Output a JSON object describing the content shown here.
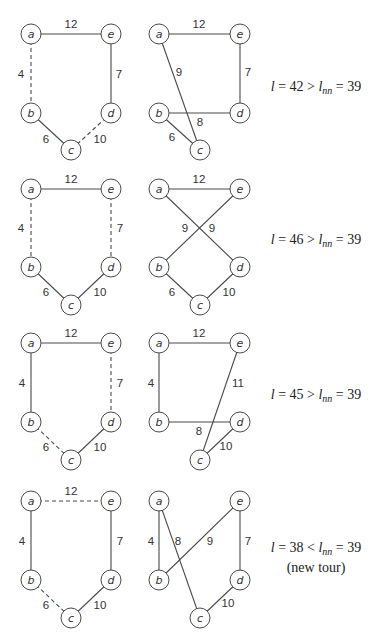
{
  "node_radius": 10,
  "rows": [
    {
      "y_offset": 0,
      "formula": {
        "l_symbol": "l",
        "value": "42",
        "op": ">",
        "nn_symbol": "l",
        "nn_sub": "nn",
        "nn_value": "39",
        "note": ""
      },
      "panels": [
        {
          "name": "original-tour",
          "nodes": {
            "a": [
              31,
              34
            ],
            "e": [
              111,
              34
            ],
            "b": [
              31,
              113
            ],
            "d": [
              111,
              113
            ],
            "c": [
              71,
              150
            ]
          },
          "edges": [
            {
              "from": "a",
              "to": "e",
              "weight": "12",
              "dashed": false,
              "label_pos": [
                71,
                24
              ]
            },
            {
              "from": "a",
              "to": "b",
              "weight": "4",
              "dashed": true,
              "label_pos": [
                21,
                74
              ]
            },
            {
              "from": "e",
              "to": "d",
              "weight": "7",
              "dashed": false,
              "label_pos": [
                119,
                74
              ]
            },
            {
              "from": "b",
              "to": "c",
              "weight": "6",
              "dashed": false,
              "label_pos": [
                46,
                139
              ]
            },
            {
              "from": "d",
              "to": "c",
              "weight": "10",
              "dashed": true,
              "label_pos": [
                100,
                139
              ]
            }
          ]
        },
        {
          "name": "modified-tour",
          "nodes": {
            "a": [
              159,
              34
            ],
            "e": [
              240,
              34
            ],
            "b": [
              159,
              113
            ],
            "d": [
              240,
              113
            ],
            "c": [
              200,
              150
            ]
          },
          "edges": [
            {
              "from": "a",
              "to": "e",
              "weight": "12",
              "dashed": false,
              "label_pos": [
                199,
                24
              ]
            },
            {
              "from": "a",
              "to": "c",
              "weight": "9",
              "dashed": false,
              "label_pos": [
                179,
                72
              ]
            },
            {
              "from": "e",
              "to": "d",
              "weight": "7",
              "dashed": false,
              "label_pos": [
                248,
                72
              ]
            },
            {
              "from": "b",
              "to": "d",
              "weight": "8",
              "dashed": false,
              "label_pos": [
                200,
                122
              ]
            },
            {
              "from": "b",
              "to": "c",
              "weight": "6",
              "dashed": false,
              "label_pos": [
                172,
                137
              ]
            }
          ]
        }
      ]
    },
    {
      "y_offset": 0,
      "formula": {
        "l_symbol": "l",
        "value": "46",
        "op": ">",
        "nn_symbol": "l",
        "nn_sub": "nn",
        "nn_value": "39",
        "note": ""
      },
      "panels": [
        {
          "name": "original-tour",
          "nodes": {
            "a": [
              31,
              189
            ],
            "e": [
              111,
              189
            ],
            "b": [
              31,
              267
            ],
            "d": [
              111,
              267
            ],
            "c": [
              71,
              305
            ]
          },
          "edges": [
            {
              "from": "a",
              "to": "e",
              "weight": "12",
              "dashed": false,
              "label_pos": [
                71,
                179
              ]
            },
            {
              "from": "a",
              "to": "b",
              "weight": "4",
              "dashed": true,
              "label_pos": [
                21,
                228
              ]
            },
            {
              "from": "e",
              "to": "d",
              "weight": "7",
              "dashed": true,
              "label_pos": [
                120,
                228
              ]
            },
            {
              "from": "b",
              "to": "c",
              "weight": "6",
              "dashed": false,
              "label_pos": [
                46,
                292
              ]
            },
            {
              "from": "d",
              "to": "c",
              "weight": "10",
              "dashed": false,
              "label_pos": [
                100,
                292
              ]
            }
          ]
        },
        {
          "name": "modified-tour",
          "nodes": {
            "a": [
              159,
              189
            ],
            "e": [
              240,
              189
            ],
            "b": [
              159,
              267
            ],
            "d": [
              240,
              267
            ],
            "c": [
              200,
              305
            ]
          },
          "edges": [
            {
              "from": "a",
              "to": "e",
              "weight": "12",
              "dashed": false,
              "label_pos": [
                199,
                179
              ]
            },
            {
              "from": "a",
              "to": "d",
              "weight": "9",
              "dashed": false,
              "label_pos": [
                212,
                228
              ]
            },
            {
              "from": "e",
              "to": "b",
              "weight": "9",
              "dashed": false,
              "label_pos": [
                185,
                228
              ]
            },
            {
              "from": "b",
              "to": "c",
              "weight": "6",
              "dashed": false,
              "label_pos": [
                172,
                292
              ]
            },
            {
              "from": "d",
              "to": "c",
              "weight": "10",
              "dashed": false,
              "label_pos": [
                229,
                292
              ]
            }
          ]
        }
      ]
    },
    {
      "y_offset": 0,
      "formula": {
        "l_symbol": "l",
        "value": "45",
        "op": ">",
        "nn_symbol": "l",
        "nn_sub": "nn",
        "nn_value": "39",
        "note": ""
      },
      "panels": [
        {
          "name": "original-tour",
          "nodes": {
            "a": [
              31,
              343
            ],
            "e": [
              111,
              343
            ],
            "b": [
              31,
              422
            ],
            "d": [
              111,
              422
            ],
            "c": [
              71,
              460
            ]
          },
          "edges": [
            {
              "from": "a",
              "to": "e",
              "weight": "12",
              "dashed": false,
              "label_pos": [
                71,
                333
              ]
            },
            {
              "from": "a",
              "to": "b",
              "weight": "4",
              "dashed": false,
              "label_pos": [
                22,
                383
              ]
            },
            {
              "from": "e",
              "to": "d",
              "weight": "7",
              "dashed": true,
              "label_pos": [
                120,
                383
              ]
            },
            {
              "from": "b",
              "to": "c",
              "weight": "6",
              "dashed": true,
              "label_pos": [
                46,
                447
              ]
            },
            {
              "from": "d",
              "to": "c",
              "weight": "10",
              "dashed": false,
              "label_pos": [
                100,
                447
              ]
            }
          ]
        },
        {
          "name": "modified-tour",
          "nodes": {
            "a": [
              159,
              343
            ],
            "e": [
              240,
              343
            ],
            "b": [
              159,
              422
            ],
            "d": [
              240,
              422
            ],
            "c": [
              200,
              460
            ]
          },
          "edges": [
            {
              "from": "a",
              "to": "e",
              "weight": "12",
              "dashed": false,
              "label_pos": [
                199,
                333
              ]
            },
            {
              "from": "a",
              "to": "b",
              "weight": "4",
              "dashed": false,
              "label_pos": [
                151,
                383
              ]
            },
            {
              "from": "e",
              "to": "c",
              "weight": "11",
              "dashed": false,
              "label_pos": [
                238,
                383
              ]
            },
            {
              "from": "b",
              "to": "d",
              "weight": "8",
              "dashed": false,
              "label_pos": [
                199,
                431
              ]
            },
            {
              "from": "d",
              "to": "c",
              "weight": "10",
              "dashed": false,
              "label_pos": [
                226,
                446
              ]
            }
          ]
        }
      ]
    },
    {
      "y_offset": 0,
      "formula": {
        "l_symbol": "l",
        "value": "38",
        "op": "<",
        "nn_symbol": "l",
        "nn_sub": "nn",
        "nn_value": "39",
        "note": "(new tour)"
      },
      "panels": [
        {
          "name": "original-tour",
          "nodes": {
            "a": [
              31,
              501
            ],
            "e": [
              111,
              501
            ],
            "b": [
              31,
              580
            ],
            "d": [
              111,
              580
            ],
            "c": [
              71,
              618
            ]
          },
          "edges": [
            {
              "from": "a",
              "to": "e",
              "weight": "12",
              "dashed": true,
              "label_pos": [
                71,
                491
              ]
            },
            {
              "from": "a",
              "to": "b",
              "weight": "4",
              "dashed": false,
              "label_pos": [
                22,
                541
              ]
            },
            {
              "from": "e",
              "to": "d",
              "weight": "7",
              "dashed": false,
              "label_pos": [
                120,
                541
              ]
            },
            {
              "from": "b",
              "to": "c",
              "weight": "6",
              "dashed": true,
              "label_pos": [
                46,
                605
              ]
            },
            {
              "from": "d",
              "to": "c",
              "weight": "10",
              "dashed": false,
              "label_pos": [
                100,
                605
              ]
            }
          ]
        },
        {
          "name": "modified-tour",
          "nodes": {
            "a": [
              159,
              501
            ],
            "e": [
              240,
              501
            ],
            "b": [
              159,
              580
            ],
            "d": [
              240,
              580
            ],
            "c": [
              200,
              618
            ]
          },
          "edges": [
            {
              "from": "a",
              "to": "b",
              "weight": "4",
              "dashed": false,
              "label_pos": [
                151,
                541
              ]
            },
            {
              "from": "a",
              "to": "c",
              "weight": "8",
              "dashed": false,
              "label_pos": [
                178,
                541
              ]
            },
            {
              "from": "e",
              "to": "b",
              "weight": "9",
              "dashed": false,
              "label_pos": [
                210,
                541
              ]
            },
            {
              "from": "e",
              "to": "d",
              "weight": "7",
              "dashed": false,
              "label_pos": [
                248,
                541
              ]
            },
            {
              "from": "d",
              "to": "c",
              "weight": "10",
              "dashed": false,
              "label_pos": [
                228,
                603
              ]
            }
          ]
        }
      ]
    }
  ],
  "formula_positions": [
    [
      255,
      79
    ],
    [
      255,
      232
    ],
    [
      255,
      387
    ],
    [
      255,
      540
    ]
  ]
}
